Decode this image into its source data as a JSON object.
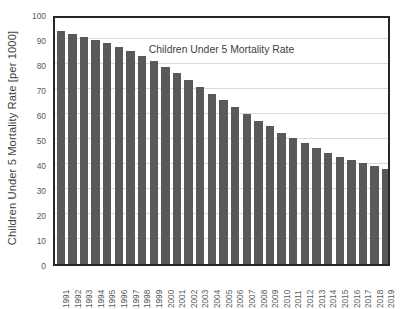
{
  "chart_data": {
    "type": "bar",
    "title": "Children Under 5 Mortality Rate",
    "xlabel": "",
    "ylabel": "Children Under 5 Mortality Rate [per 1000]",
    "ylim": [
      0,
      100
    ],
    "ytick_labels": [
      "0",
      "10",
      "20",
      "30",
      "40",
      "50",
      "60",
      "70",
      "80",
      "90",
      "100"
    ],
    "ytick_values": [
      0,
      10,
      20,
      30,
      40,
      50,
      60,
      70,
      80,
      90,
      100
    ],
    "grid": "horizontal",
    "legend": "none",
    "bar_color": "#595959",
    "plot_border_color": "#262626",
    "gridline_color": "#d9d9d9",
    "categories": [
      "1991",
      "1992",
      "1993",
      "1994",
      "1995",
      "1996",
      "1997",
      "1998",
      "1999",
      "2000",
      "2001",
      "2002",
      "2003",
      "2004",
      "2005",
      "2006",
      "2007",
      "2008",
      "2009",
      "2010",
      "2011",
      "2012",
      "2013",
      "2014",
      "2015",
      "2016",
      "2017",
      "2018",
      "2019"
    ],
    "values": [
      93.4,
      92.1,
      90.8,
      89.6,
      88.4,
      86.8,
      85.1,
      83.1,
      81.1,
      78.7,
      76.3,
      73.6,
      70.9,
      68.2,
      65.6,
      62.7,
      60.1,
      57.4,
      55.1,
      52.6,
      50.6,
      48.3,
      46.4,
      44.6,
      43.0,
      41.6,
      40.3,
      39.1,
      37.9
    ]
  }
}
